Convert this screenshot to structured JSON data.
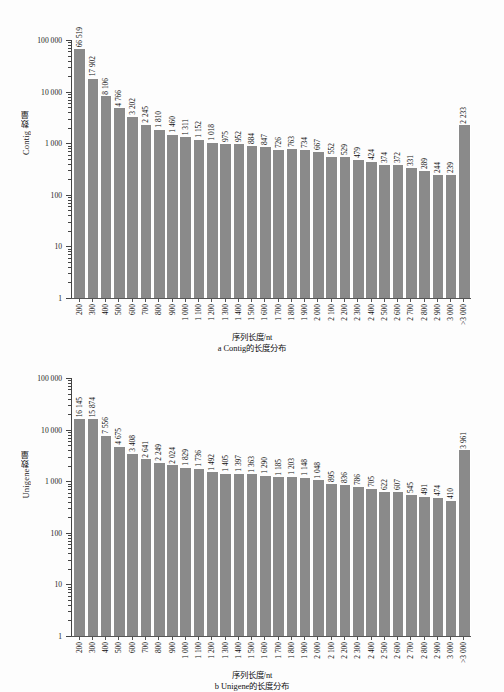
{
  "chart_data": [
    {
      "type": "bar",
      "id": "contig-length-distribution",
      "title": "",
      "caption_axis": "序列长度/nt",
      "caption_label": "a Contig的长度分布",
      "xlabel": "序列长度/nt",
      "ylabel": "Contig 数量",
      "yscale": "log",
      "ylim": [
        1,
        100000
      ],
      "ytick_labels": [
        "1",
        "10",
        "100",
        "1 000",
        "10 000",
        "100 000"
      ],
      "ytick_values": [
        1,
        10,
        100,
        1000,
        10000,
        100000
      ],
      "grid": false,
      "legend": "none",
      "categories": [
        "200",
        "300",
        "400",
        "500",
        "600",
        "700",
        "800",
        "900",
        "1 000",
        "1 100",
        "1 200",
        "1 300",
        "1 400",
        "1 500",
        "1 600",
        "1 700",
        "1 800",
        "1 900",
        "2 000",
        "2 100",
        "2 200",
        "2 300",
        "2 400",
        "2 500",
        "2 600",
        "2 700",
        "2 800",
        "2 900",
        "3 000",
        ">3 000"
      ],
      "values": [
        66519,
        17902,
        8106,
        4766,
        3202,
        2245,
        1810,
        1460,
        1311,
        1152,
        1018,
        975,
        952,
        884,
        847,
        726,
        763,
        734,
        667,
        552,
        529,
        479,
        424,
        374,
        372,
        331,
        289,
        244,
        239,
        2233
      ],
      "value_labels": [
        "66 519",
        "17 902",
        "8 106",
        "4 766",
        "3 202",
        "2 245",
        "1 810",
        "1 460",
        "1 311",
        "1 152",
        "1 018",
        "975",
        "952",
        "884",
        "847",
        "726",
        "763",
        "734",
        "667",
        "552",
        "529",
        "479",
        "424",
        "374",
        "372",
        "331",
        "289",
        "244",
        "239",
        "2 233"
      ]
    },
    {
      "type": "bar",
      "id": "unigene-length-distribution",
      "title": "",
      "caption_axis": "序列长度/nt",
      "caption_label": "b Unigene的长度分布",
      "xlabel": "序列长度/nt",
      "ylabel": "Unigene数量",
      "yscale": "log",
      "ylim": [
        1,
        100000
      ],
      "ytick_labels": [
        "1",
        "10",
        "100",
        "1 000",
        "10 000",
        "100 000"
      ],
      "ytick_values": [
        1,
        10,
        100,
        1000,
        10000,
        100000
      ],
      "grid": false,
      "legend": "none",
      "categories": [
        "200",
        "300",
        "400",
        "500",
        "600",
        "700",
        "800",
        "900",
        "1 000",
        "1 100",
        "1 200",
        "1 300",
        "1 400",
        "1 500",
        "1 600",
        "1 700",
        "1 800",
        "1 900",
        "2 000",
        "2 100",
        "2 200",
        "2 300",
        "2 400",
        "2 500",
        "2 600",
        "2 700",
        "2 800",
        "2 900",
        "3 000",
        ">3 000"
      ],
      "values": [
        16145,
        15874,
        7556,
        4675,
        3408,
        2641,
        2249,
        2024,
        1829,
        1736,
        1492,
        1405,
        1397,
        1363,
        1290,
        1185,
        1203,
        1148,
        1048,
        895,
        836,
        786,
        705,
        622,
        607,
        545,
        491,
        474,
        410,
        3961
      ],
      "value_labels": [
        "16 145",
        "15 874",
        "7 556",
        "4 675",
        "3 408",
        "2 641",
        "2 249",
        "2 024",
        "1 829",
        "1 736",
        "1 492",
        "1 405",
        "1 397",
        "1 363",
        "1 290",
        "1 185",
        "1 203",
        "1 148",
        "1 048",
        "895",
        "836",
        "786",
        "705",
        "622",
        "607",
        "545",
        "491",
        "474",
        "410",
        "3 961"
      ]
    }
  ],
  "style": {
    "bar_color": "#8a8a8a",
    "axis_color": "#555555",
    "text_color": "#111111",
    "background": "#fdfdfd"
  }
}
